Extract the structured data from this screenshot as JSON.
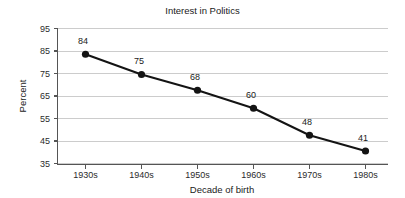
{
  "chart_data": {
    "type": "line",
    "title": "Interest in Politics",
    "xlabel": "Decade of birth",
    "ylabel": "Percent",
    "categories": [
      "1930s",
      "1940s",
      "1950s",
      "1960s",
      "1970s",
      "1980s"
    ],
    "values": [
      84,
      75,
      68,
      60,
      48,
      41
    ],
    "point_labels": [
      "84",
      "75",
      "68",
      "60",
      "48",
      "41"
    ],
    "ylim": [
      35,
      95
    ],
    "yticks": [
      35,
      45,
      55,
      65,
      75,
      85,
      95
    ],
    "ytick_labels": [
      "35",
      "45",
      "55",
      "65",
      "75",
      "85",
      "95"
    ],
    "xtick_labels": [
      "1930s",
      "1940s",
      "1950s",
      "1960s",
      "1970s",
      "1980s"
    ],
    "grid": true,
    "grid_axis": "y",
    "legend": false,
    "legend_position": "none",
    "series_color": "#141414",
    "grid_color": "#cccccc",
    "axis_color": "#555555",
    "background_color": "#ffffff",
    "marker": "circle",
    "show_data_labels": true
  }
}
